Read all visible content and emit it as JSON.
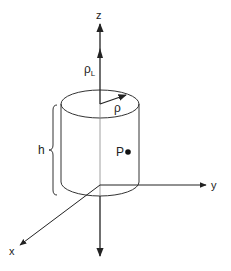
{
  "diagram": {
    "labels": {
      "z_axis": "z",
      "y_axis": "y",
      "x_axis": "x",
      "line_charge": "ρ",
      "line_charge_sub": "L",
      "radius": "ρ",
      "height": "h",
      "point": "P"
    },
    "colors": {
      "stroke": "#222222",
      "thin_stroke": "#555555",
      "background": "#ffffff"
    }
  }
}
